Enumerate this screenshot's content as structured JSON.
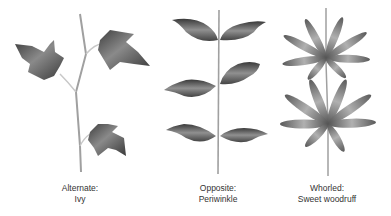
{
  "panels": [
    {
      "id": "alternate",
      "arrangement": "Alternate:",
      "example": "Ivy"
    },
    {
      "id": "opposite",
      "arrangement": "Opposite:",
      "example": "Periwinkle"
    },
    {
      "id": "whorled",
      "arrangement": "Whorled:",
      "example": "Sweet woodruff"
    }
  ],
  "colors": {
    "leaf_dark": "#4a4a4a",
    "leaf_mid": "#7a7a7a",
    "leaf_light": "#a8a8a8",
    "stem": "#9a9a9a",
    "text": "#333333"
  }
}
